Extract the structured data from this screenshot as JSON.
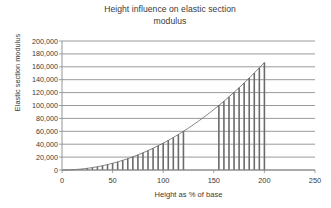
{
  "chart_data": {
    "type": "bar",
    "title": "Height influence on elastic section modulus",
    "title_line1": "Height influence on elastic section",
    "title_line2": "modulus",
    "xlabel": "Height as % of base",
    "ylabel": "Elastic section modulus",
    "xlim": [
      0,
      250
    ],
    "ylim": [
      0,
      200000
    ],
    "grid": true,
    "legend": "none",
    "x_ticks": [
      0,
      50,
      100,
      150,
      200,
      250
    ],
    "x_tick_labels": [
      "0",
      "50",
      "100",
      "150",
      "200",
      "250"
    ],
    "y_ticks": [
      0,
      20000,
      40000,
      60000,
      80000,
      100000,
      120000,
      140000,
      160000,
      180000,
      200000
    ],
    "y_tick_labels": [
      "0",
      "20,000",
      "40,000",
      "60,000",
      "80,000",
      "100,000",
      "120,000",
      "140,000",
      "160,000",
      "180,000",
      "200,000"
    ],
    "bar_color": "#6b6b6b",
    "gridline_color": "#808080",
    "axis_color": "#808080",
    "x": [
      5,
      10,
      15,
      20,
      25,
      30,
      35,
      40,
      45,
      50,
      55,
      60,
      65,
      70,
      75,
      80,
      85,
      90,
      95,
      100,
      105,
      110,
      115,
      120,
      155,
      160,
      165,
      170,
      175,
      180,
      185,
      190,
      195,
      200
    ],
    "values": [
      104,
      417,
      938,
      1667,
      2604,
      3750,
      5104,
      6667,
      8438,
      10417,
      12604,
      15000,
      17604,
      20417,
      23438,
      26667,
      30104,
      33750,
      37604,
      41667,
      45938,
      50417,
      55104,
      60000,
      100104,
      106667,
      113438,
      120417,
      127604,
      135000,
      142604,
      150417,
      158438,
      166667
    ]
  }
}
